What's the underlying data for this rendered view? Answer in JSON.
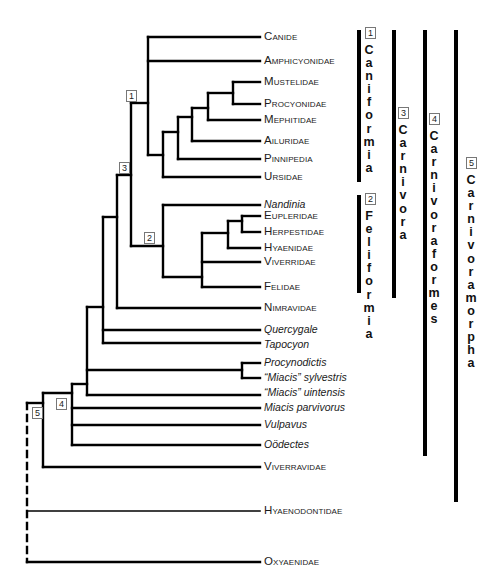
{
  "diagram": {
    "type": "phylogenetic-tree",
    "colors": {
      "line": "#000000",
      "text": "#1a1a1a",
      "node_box_border": "#777777"
    }
  },
  "taxa": [
    {
      "name": "Canide",
      "style": "sc",
      "y": 37
    },
    {
      "name": "Amphicyonidae",
      "style": "sc",
      "y": 61
    },
    {
      "name": "Mustelidae",
      "style": "sc",
      "y": 82
    },
    {
      "name": "Procyonidae",
      "style": "sc",
      "y": 104
    },
    {
      "name": "Mephitidae",
      "style": "sc",
      "y": 120
    },
    {
      "name": "Ailuridae",
      "style": "sc",
      "y": 141
    },
    {
      "name": "Pinnipedia",
      "style": "sc",
      "y": 159
    },
    {
      "name": "Ursidae",
      "style": "sc",
      "y": 177
    },
    {
      "name": "Nandinia",
      "style": "it",
      "y": 205
    },
    {
      "name": "Eupleridae",
      "style": "sc",
      "y": 216
    },
    {
      "name": "Herpestidae",
      "style": "sc",
      "y": 232
    },
    {
      "name": "Hyaenidae",
      "style": "sc",
      "y": 248
    },
    {
      "name": "Viverridae",
      "style": "sc",
      "y": 262
    },
    {
      "name": "Felidae",
      "style": "sc",
      "y": 287
    },
    {
      "name": "Nimravidae",
      "style": "sc",
      "y": 308
    },
    {
      "name": "Quercygale",
      "style": "it",
      "y": 330
    },
    {
      "name": "Tapocyon",
      "style": "it",
      "y": 345
    },
    {
      "name": "Procynodictis",
      "style": "it",
      "y": 363
    },
    {
      "name": "“Miacis” sylvestris",
      "style": "it",
      "y": 378
    },
    {
      "name": "“Miacis” uintensis",
      "style": "it",
      "y": 393
    },
    {
      "name": "Miacis parvivorus",
      "style": "it",
      "y": 408
    },
    {
      "name": "Vulpavus",
      "style": "it",
      "y": 425
    },
    {
      "name": "Oödectes",
      "style": "it",
      "y": 445
    },
    {
      "name": "Viverravidae",
      "style": "sc",
      "y": 467
    },
    {
      "name": "Hyaenodontidae",
      "style": "sc",
      "y": 511
    },
    {
      "name": "Oxyaenidae",
      "style": "sc",
      "y": 562
    }
  ],
  "node_markers": [
    {
      "number": "1",
      "x": 126,
      "y": 90
    },
    {
      "number": "2",
      "x": 144,
      "y": 232
    },
    {
      "number": "3",
      "x": 119,
      "y": 162
    },
    {
      "number": "4",
      "x": 56,
      "y": 398
    },
    {
      "number": "5",
      "x": 32,
      "y": 407
    }
  ],
  "clades": [
    {
      "number": "1",
      "name": "Caniformia",
      "bar_x": 357,
      "bar_top": 30,
      "bar_bottom": 182,
      "box_x": 365,
      "box_y": 27,
      "text_x": 363,
      "text_top": 44
    },
    {
      "number": "2",
      "name": "Feliformia",
      "bar_x": 357,
      "bar_top": 195,
      "bar_bottom": 293,
      "box_x": 365,
      "box_y": 193,
      "text_x": 363,
      "text_top": 210
    },
    {
      "number": "3",
      "name": "Carnivora",
      "bar_x": 392,
      "bar_top": 30,
      "bar_bottom": 298,
      "box_x": 398,
      "box_y": 107,
      "text_x": 397,
      "text_top": 124
    },
    {
      "number": "4",
      "name": "Carnivoraformes",
      "bar_x": 423,
      "bar_top": 30,
      "bar_bottom": 456,
      "box_x": 429,
      "box_y": 113,
      "text_x": 428,
      "text_top": 130
    },
    {
      "number": "5",
      "name": "Carnivoramorpha",
      "bar_x": 454,
      "bar_top": 30,
      "bar_bottom": 502,
      "box_x": 466,
      "box_y": 157,
      "text_x": 465,
      "text_top": 174
    }
  ],
  "tree_lines": [
    [
      148,
      37,
      260,
      37
    ],
    [
      148,
      61,
      260,
      61
    ],
    [
      148,
      37,
      148,
      155
    ],
    [
      131,
      103,
      148,
      103
    ],
    [
      233,
      82,
      260,
      82
    ],
    [
      233,
      104,
      260,
      104
    ],
    [
      233,
      82,
      233,
      104
    ],
    [
      208,
      93,
      233,
      93
    ],
    [
      208,
      120,
      260,
      120
    ],
    [
      208,
      93,
      208,
      120
    ],
    [
      192,
      108,
      208,
      108
    ],
    [
      192,
      141,
      260,
      141
    ],
    [
      192,
      108,
      192,
      141
    ],
    [
      178,
      117,
      192,
      117
    ],
    [
      178,
      159,
      260,
      159
    ],
    [
      178,
      117,
      178,
      159
    ],
    [
      163,
      132,
      178,
      132
    ],
    [
      163,
      177,
      260,
      177
    ],
    [
      163,
      132,
      163,
      177
    ],
    [
      148,
      155,
      163,
      155
    ],
    [
      131,
      103,
      131,
      246
    ],
    [
      131,
      246,
      163,
      246
    ],
    [
      163,
      205,
      260,
      205
    ],
    [
      163,
      205,
      163,
      277
    ],
    [
      163,
      277,
      202,
      277
    ],
    [
      202,
      233,
      202,
      287
    ],
    [
      202,
      287,
      260,
      287
    ],
    [
      202,
      262,
      260,
      262
    ],
    [
      202,
      233,
      228,
      233
    ],
    [
      228,
      221,
      228,
      248
    ],
    [
      228,
      248,
      260,
      248
    ],
    [
      228,
      221,
      242,
      221
    ],
    [
      242,
      216,
      242,
      232
    ],
    [
      242,
      216,
      260,
      216
    ],
    [
      242,
      232,
      260,
      232
    ],
    [
      117,
      175,
      131,
      175
    ],
    [
      117,
      175,
      117,
      308
    ],
    [
      117,
      308,
      260,
      308
    ],
    [
      103,
      217,
      117,
      217
    ],
    [
      103,
      217,
      103,
      343
    ],
    [
      103,
      330,
      260,
      330
    ],
    [
      103,
      343,
      260,
      343
    ],
    [
      87,
      307,
      103,
      307
    ],
    [
      87,
      307,
      87,
      395
    ],
    [
      87,
      370,
      242,
      370
    ],
    [
      87,
      395,
      260,
      395
    ],
    [
      242,
      363,
      242,
      378
    ],
    [
      242,
      363,
      260,
      363
    ],
    [
      242,
      378,
      260,
      378
    ],
    [
      72,
      384,
      87,
      384
    ],
    [
      72,
      384,
      72,
      445
    ],
    [
      72,
      408,
      260,
      408
    ],
    [
      72,
      425,
      260,
      425
    ],
    [
      72,
      445,
      260,
      445
    ],
    [
      43,
      393,
      72,
      393
    ],
    [
      43,
      393,
      43,
      467
    ],
    [
      43,
      467,
      260,
      467
    ],
    [
      27,
      403,
      43,
      403
    ]
  ],
  "thin_lines": [
    [
      28,
      511,
      260,
      511
    ]
  ],
  "dashed_lines": [
    [
      27,
      403,
      27,
      562
    ]
  ],
  "solid_tail_lines": [
    [
      27,
      562,
      260,
      562
    ]
  ]
}
